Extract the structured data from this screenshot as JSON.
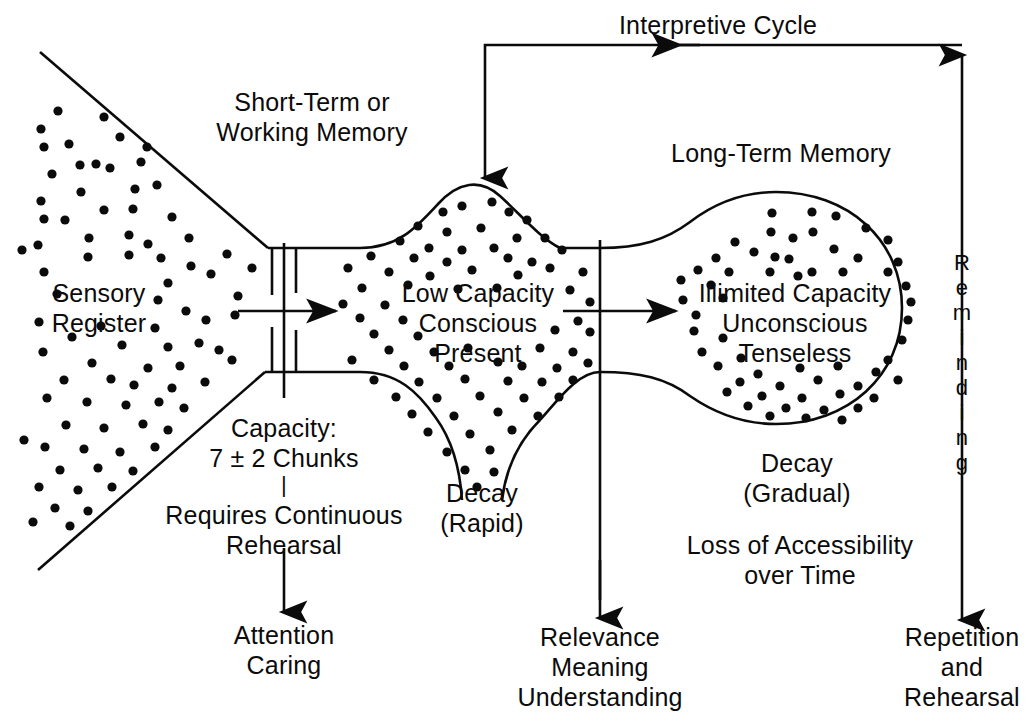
{
  "diagram": {
    "ink_color": "#0b0b0b",
    "background_color": "#ffffff"
  },
  "labels": {
    "interpretive_cycle": "Interpretive Cycle",
    "short_term": "Short-Term or\nWorking Memory",
    "long_term": "Long-Term Memory",
    "sensory_register": "Sensory\nRegister",
    "low_capacity": "Low Capacity\nConscious\nPresent",
    "illimited_capacity": "Illimited Capacity\nUnconscious\nTenseless",
    "capacity_chunks": "Capacity:\n7 ± 2 Chunks",
    "requires_rehearsal": "Requires Continuous\nRehearsal",
    "attention_caring": "Attention\nCaring",
    "decay_rapid": "Decay\n(Rapid)",
    "decay_gradual": "Decay\n(Gradual)",
    "loss_accessibility": "Loss of Accessibility\nover Time",
    "relevance_meaning": "Relevance\nMeaning\nUnderstanding",
    "repetition_rehearsal": "Repetition\nand\nRehearsal",
    "reminding_letters": [
      "R",
      "e",
      "m",
      "i",
      "n",
      "d",
      "i",
      "n",
      "g"
    ],
    "dash_separator": "|"
  },
  "chart_data": {
    "type": "diagram",
    "stages": [
      {
        "name": "Sensory Register",
        "shape": "cone",
        "notes": "Large dotted funnel open to the left, converging at the attention valve"
      },
      {
        "name": "Short-Term or Working Memory",
        "shape": "rounded-diamond",
        "capacity": "7 ± 2 Chunks",
        "attributes": [
          "Low Capacity",
          "Conscious",
          "Present"
        ],
        "decay": "Rapid"
      },
      {
        "name": "Long-Term Memory",
        "shape": "circle-with-neck",
        "attributes": [
          "Illimited Capacity",
          "Unconscious",
          "Tenseless"
        ],
        "decay": "Gradual",
        "notes": "Loss of Accessibility over Time"
      }
    ],
    "flows": [
      {
        "from": "Sensory Register",
        "to": "Short-Term or Working Memory",
        "gate": "Attention / Caring valve"
      },
      {
        "from": "Short-Term or Working Memory",
        "to": "Long-Term Memory",
        "gate": "Relevance / Meaning / Understanding"
      },
      {
        "from": "Long-Term Memory",
        "to": "Short-Term or Working Memory",
        "label": "Interpretive Cycle"
      },
      {
        "from": "Long-Term Memory",
        "to": "Repetition and Rehearsal",
        "label": "Reminding",
        "bidirectional": true
      }
    ]
  }
}
